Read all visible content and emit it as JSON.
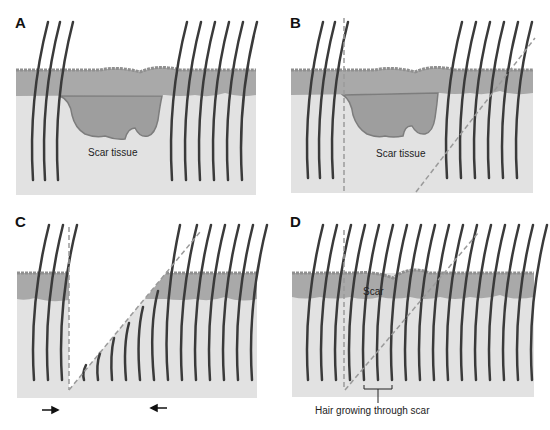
{
  "figure": {
    "panels": [
      {
        "id": "A",
        "letter": "A",
        "label": "Scar tissue"
      },
      {
        "id": "B",
        "letter": "B",
        "label": "Scar tissue"
      },
      {
        "id": "C",
        "letter": "C"
      },
      {
        "id": "D",
        "letter": "D",
        "label": "Scar",
        "annotation": "Hair growing through scar"
      }
    ],
    "colors": {
      "epidermis": "#a9a9a9",
      "epidermis_top": "#8f8f8f",
      "dermis": "#e2e2e2",
      "scar": "#9e9e9e",
      "scar_edge": "#7d7d7d",
      "hair": "#3a3a3a",
      "incision_line": "#9a9a9a"
    }
  }
}
